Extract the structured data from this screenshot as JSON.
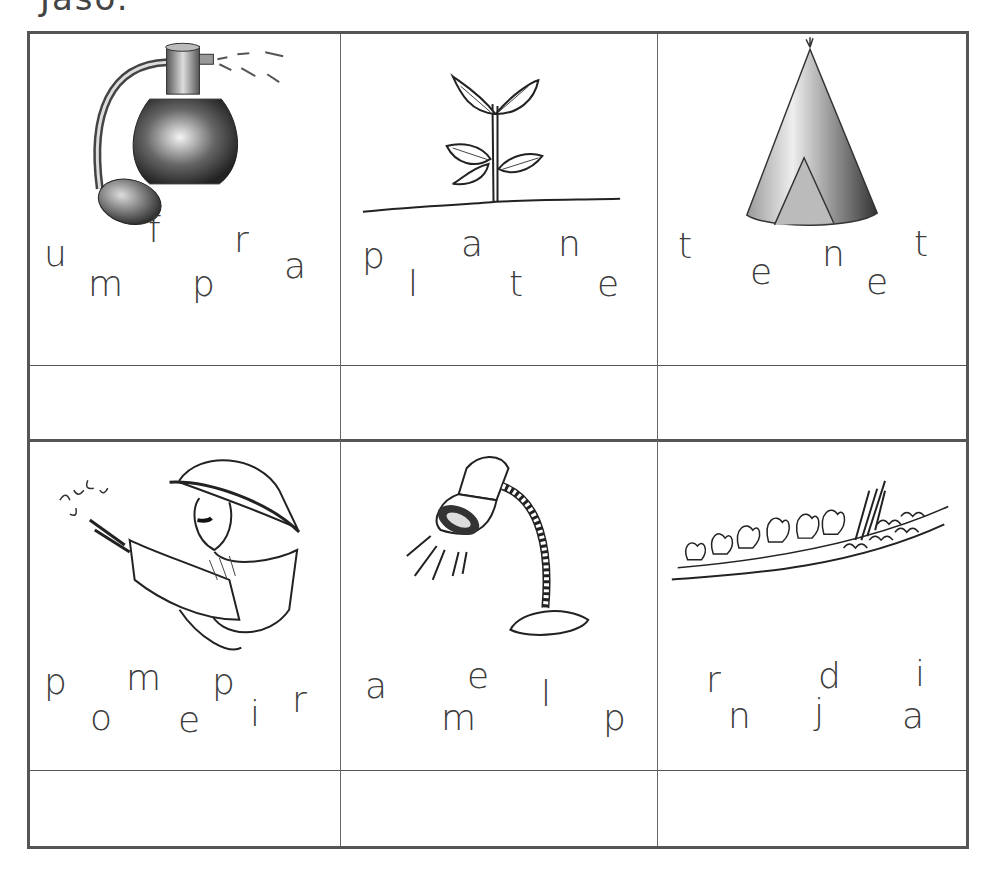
{
  "page": {
    "top_cut_text": "Jaso."
  },
  "puzzles": [
    {
      "picture": "perfume-bottle-icon",
      "answer": "",
      "letters": [
        {
          "ch": "u",
          "x": 14,
          "y": 232
        },
        {
          "ch": "f",
          "x": 118,
          "y": 208
        },
        {
          "ch": "r",
          "x": 204,
          "y": 218
        },
        {
          "ch": "m",
          "x": 58,
          "y": 262
        },
        {
          "ch": "p",
          "x": 162,
          "y": 262
        },
        {
          "ch": "a",
          "x": 254,
          "y": 244
        }
      ]
    },
    {
      "picture": "plant-seedling-icon",
      "answer": "",
      "letters": [
        {
          "ch": "p",
          "x": 21,
          "y": 234
        },
        {
          "ch": "a",
          "x": 120,
          "y": 222
        },
        {
          "ch": "n",
          "x": 217,
          "y": 222
        },
        {
          "ch": "l",
          "x": 67,
          "y": 262
        },
        {
          "ch": "t",
          "x": 168,
          "y": 262
        },
        {
          "ch": "e",
          "x": 256,
          "y": 262
        }
      ]
    },
    {
      "picture": "tent-tepee-icon",
      "answer": "",
      "letters": [
        {
          "ch": "t",
          "x": 20,
          "y": 224
        },
        {
          "ch": "e",
          "x": 92,
          "y": 250
        },
        {
          "ch": "n",
          "x": 164,
          "y": 232
        },
        {
          "ch": "t",
          "x": 256,
          "y": 222
        },
        {
          "ch": "e",
          "x": 208,
          "y": 260
        }
      ]
    },
    {
      "picture": "firefighter-hose-icon",
      "answer": "",
      "letters": [
        {
          "ch": "p",
          "x": 14,
          "y": 254
        },
        {
          "ch": "m",
          "x": 96,
          "y": 250
        },
        {
          "ch": "p",
          "x": 182,
          "y": 254
        },
        {
          "ch": "r",
          "x": 262,
          "y": 272
        },
        {
          "ch": "o",
          "x": 60,
          "y": 290
        },
        {
          "ch": "e",
          "x": 148,
          "y": 292
        },
        {
          "ch": "i",
          "x": 220,
          "y": 286
        }
      ]
    },
    {
      "picture": "desk-lamp-icon",
      "answer": "",
      "letters": [
        {
          "ch": "a",
          "x": 24,
          "y": 258
        },
        {
          "ch": "e",
          "x": 126,
          "y": 248
        },
        {
          "ch": "l",
          "x": 200,
          "y": 266
        },
        {
          "ch": "m",
          "x": 100,
          "y": 290
        },
        {
          "ch": "p",
          "x": 262,
          "y": 290
        }
      ]
    },
    {
      "picture": "vegetable-garden-icon",
      "answer": "",
      "letters": [
        {
          "ch": "r",
          "x": 48,
          "y": 252
        },
        {
          "ch": "d",
          "x": 160,
          "y": 248
        },
        {
          "ch": "i",
          "x": 257,
          "y": 246
        },
        {
          "ch": "n",
          "x": 70,
          "y": 288
        },
        {
          "ch": "j",
          "x": 156,
          "y": 284
        },
        {
          "ch": "a",
          "x": 244,
          "y": 288
        }
      ]
    }
  ]
}
